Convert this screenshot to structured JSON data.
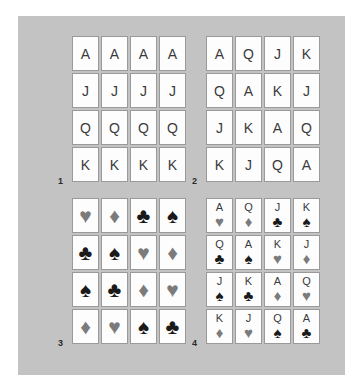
{
  "figure": {
    "background_color": "#ffffff",
    "panel_color": "#c3c3c3",
    "card_face_color": "#fdfdfd",
    "card_border_color": "#9a9a9a",
    "red_suit_color": "#7b7b7b",
    "black_suit_color": "#1a1a1a"
  },
  "glyphs": {
    "hearts": "♥",
    "diamonds": "♦",
    "clubs": "♣",
    "spades": "♠"
  },
  "quadrants": [
    {
      "label": "1",
      "mode": "rank",
      "rows": [
        [
          {
            "rank": "A"
          },
          {
            "rank": "A"
          },
          {
            "rank": "A"
          },
          {
            "rank": "A"
          }
        ],
        [
          {
            "rank": "J"
          },
          {
            "rank": "J"
          },
          {
            "rank": "J"
          },
          {
            "rank": "J"
          }
        ],
        [
          {
            "rank": "Q"
          },
          {
            "rank": "Q"
          },
          {
            "rank": "Q"
          },
          {
            "rank": "Q"
          }
        ],
        [
          {
            "rank": "K"
          },
          {
            "rank": "K"
          },
          {
            "rank": "K"
          },
          {
            "rank": "K"
          }
        ]
      ]
    },
    {
      "label": "2",
      "mode": "rank",
      "rows": [
        [
          {
            "rank": "A"
          },
          {
            "rank": "Q"
          },
          {
            "rank": "J"
          },
          {
            "rank": "K"
          }
        ],
        [
          {
            "rank": "Q"
          },
          {
            "rank": "A"
          },
          {
            "rank": "K"
          },
          {
            "rank": "J"
          }
        ],
        [
          {
            "rank": "J"
          },
          {
            "rank": "K"
          },
          {
            "rank": "A"
          },
          {
            "rank": "Q"
          }
        ],
        [
          {
            "rank": "K"
          },
          {
            "rank": "J"
          },
          {
            "rank": "Q"
          },
          {
            "rank": "A"
          }
        ]
      ]
    },
    {
      "label": "3",
      "mode": "suit",
      "rows": [
        [
          {
            "suit": "hearts"
          },
          {
            "suit": "diamonds"
          },
          {
            "suit": "clubs"
          },
          {
            "suit": "spades"
          }
        ],
        [
          {
            "suit": "clubs"
          },
          {
            "suit": "spades"
          },
          {
            "suit": "hearts"
          },
          {
            "suit": "diamonds"
          }
        ],
        [
          {
            "suit": "spades"
          },
          {
            "suit": "clubs"
          },
          {
            "suit": "diamonds"
          },
          {
            "suit": "hearts"
          }
        ],
        [
          {
            "suit": "diamonds"
          },
          {
            "suit": "hearts"
          },
          {
            "suit": "spades"
          },
          {
            "suit": "clubs"
          }
        ]
      ]
    },
    {
      "label": "4",
      "mode": "both",
      "rows": [
        [
          {
            "rank": "A",
            "suit": "hearts"
          },
          {
            "rank": "Q",
            "suit": "diamonds"
          },
          {
            "rank": "J",
            "suit": "clubs"
          },
          {
            "rank": "K",
            "suit": "spades"
          }
        ],
        [
          {
            "rank": "Q",
            "suit": "clubs"
          },
          {
            "rank": "A",
            "suit": "spades"
          },
          {
            "rank": "K",
            "suit": "hearts"
          },
          {
            "rank": "J",
            "suit": "diamonds"
          }
        ],
        [
          {
            "rank": "J",
            "suit": "spades"
          },
          {
            "rank": "K",
            "suit": "clubs"
          },
          {
            "rank": "A",
            "suit": "diamonds"
          },
          {
            "rank": "Q",
            "suit": "hearts"
          }
        ],
        [
          {
            "rank": "K",
            "suit": "diamonds"
          },
          {
            "rank": "J",
            "suit": "hearts"
          },
          {
            "rank": "Q",
            "suit": "spades"
          },
          {
            "rank": "A",
            "suit": "clubs"
          }
        ]
      ]
    }
  ]
}
